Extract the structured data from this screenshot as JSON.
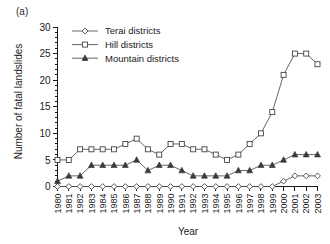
{
  "figure": {
    "panel_label": "(a)"
  },
  "chart_data": {
    "type": "line",
    "title": "",
    "subtitle": "",
    "xlabel": "Year",
    "ylabel": "Number of fatal landslides",
    "xlim": [
      1980,
      2003
    ],
    "ylim": [
      0,
      30
    ],
    "ytick_values": [
      0,
      5,
      10,
      15,
      20,
      25,
      30
    ],
    "ytick_labels": [
      "0",
      "5",
      "10",
      "15",
      "20",
      "25",
      "30"
    ],
    "yminor_step": 1,
    "grid": false,
    "legend_position": "top-center",
    "x": [
      1980,
      1981,
      1982,
      1983,
      1984,
      1985,
      1986,
      1987,
      1988,
      1989,
      1990,
      1991,
      1992,
      1993,
      1994,
      1995,
      1996,
      1997,
      1998,
      1999,
      2000,
      2001,
      2002,
      2003
    ],
    "categories": [
      "1980",
      "1981",
      "1982",
      "1983",
      "1984",
      "1985",
      "1986",
      "1987",
      "1988",
      "1989",
      "1990",
      "1991",
      "1992",
      "1993",
      "1994",
      "1995",
      "1996",
      "1997",
      "1998",
      "1999",
      "2000",
      "2001",
      "2002",
      "2003"
    ],
    "series": [
      {
        "name": "Terai districts",
        "marker": "diamond-open",
        "values": [
          0,
          0,
          0,
          0,
          0,
          0,
          0,
          0,
          0,
          0,
          0,
          0,
          0,
          0,
          0,
          0,
          0,
          0,
          0,
          0,
          1,
          2,
          2,
          2
        ]
      },
      {
        "name": "Hill districts",
        "marker": "square-open",
        "values": [
          5,
          5,
          7,
          7,
          7,
          7,
          8,
          9,
          7,
          6,
          8,
          8,
          7,
          7,
          6,
          5,
          6,
          8,
          10,
          14,
          21,
          25,
          25,
          23
        ]
      },
      {
        "name": "Mountain districts",
        "marker": "triangle-filled",
        "values": [
          1,
          2,
          2,
          4,
          4,
          4,
          4,
          5,
          3,
          4,
          4,
          3,
          2,
          2,
          2,
          2,
          3,
          3,
          4,
          4,
          5,
          6,
          6,
          6
        ]
      }
    ]
  },
  "legend": {
    "items": [
      {
        "label": "Terai districts",
        "marker": "diamond-open"
      },
      {
        "label": "Hill districts",
        "marker": "square-open"
      },
      {
        "label": "Mountain districts",
        "marker": "triangle-filled"
      }
    ]
  }
}
